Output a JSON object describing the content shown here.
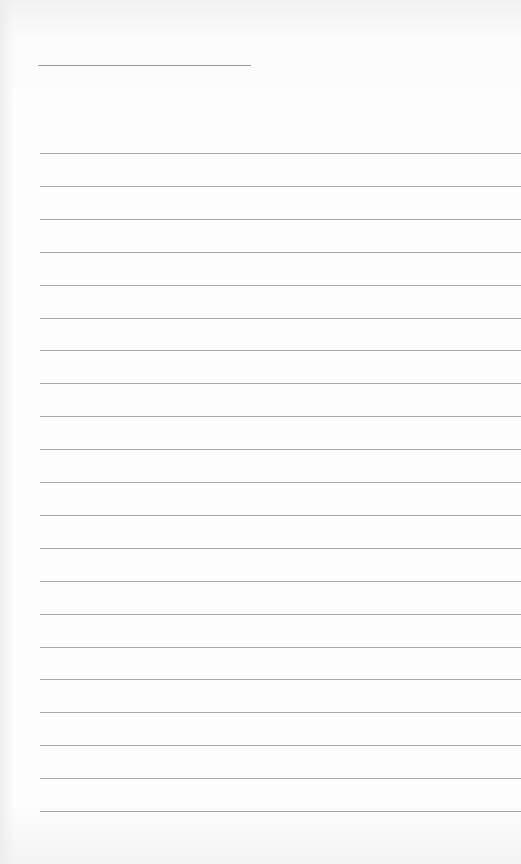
{
  "page": {
    "type": "lined-paper",
    "background": "#fdfdfd",
    "line_color": "#a8a8a8",
    "header_line": {
      "label": "",
      "value": ""
    },
    "rules_count": 21,
    "rules": [
      {
        "text": ""
      },
      {
        "text": ""
      },
      {
        "text": ""
      },
      {
        "text": ""
      },
      {
        "text": ""
      },
      {
        "text": ""
      },
      {
        "text": ""
      },
      {
        "text": ""
      },
      {
        "text": ""
      },
      {
        "text": ""
      },
      {
        "text": ""
      },
      {
        "text": ""
      },
      {
        "text": ""
      },
      {
        "text": ""
      },
      {
        "text": ""
      },
      {
        "text": ""
      },
      {
        "text": ""
      },
      {
        "text": ""
      },
      {
        "text": ""
      },
      {
        "text": ""
      },
      {
        "text": ""
      }
    ]
  }
}
